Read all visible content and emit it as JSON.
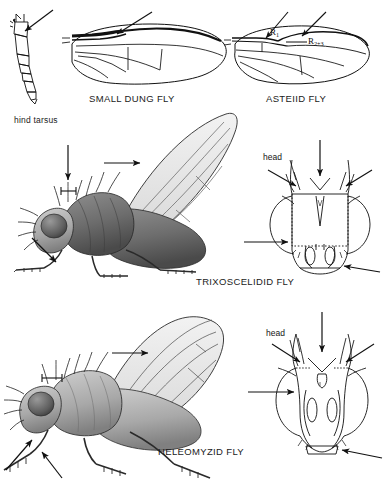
{
  "plate": {
    "background_color": "#ffffff",
    "ink_color": "#111111",
    "width": 383,
    "height": 504
  },
  "captions": {
    "hind_tarsus": "hind tarsus",
    "small_dung_fly": "SMALL DUNG FLY",
    "asteiid_fly": "ASTEIID FLY",
    "trixoscelidid_fly": "TRIXOSCELIDID FLY",
    "heleomyzid_fly": "HELEOMYZID FLY"
  },
  "vein_labels": {
    "r1_main": "R",
    "r1_sub": "1",
    "r23_main": "R",
    "r23_sub": "2+3"
  },
  "head_labels": {
    "trixoscelidid_head": "head",
    "heleomyzid_head": "head"
  },
  "figures": [
    {
      "name": "hind-tarsus-diagram",
      "type": "line-drawing",
      "subject": "hind tarsus",
      "arrows": 1
    },
    {
      "name": "small-dung-fly-wing",
      "type": "line-drawing",
      "subject": "wing with thickened dark costa",
      "arrows": 1
    },
    {
      "name": "asteiid-fly-wing",
      "type": "line-drawing",
      "subject": "wing with R1 and R2+3 veins",
      "arrows": 2
    },
    {
      "name": "trixoscelidid-fly-habitus",
      "type": "shaded-drawing",
      "subject": "lateral view of fly",
      "arrows": 3,
      "scale_bar": true
    },
    {
      "name": "trixoscelidid-fly-head",
      "type": "line-drawing",
      "subject": "frontal view of head",
      "arrows": 4
    },
    {
      "name": "heleomyzid-fly-habitus",
      "type": "shaded-drawing",
      "subject": "lateral view of fly",
      "arrows": 3,
      "scale_bar": true
    },
    {
      "name": "heleomyzid-fly-head",
      "type": "line-drawing",
      "subject": "frontal view of head",
      "arrows": 4
    }
  ]
}
